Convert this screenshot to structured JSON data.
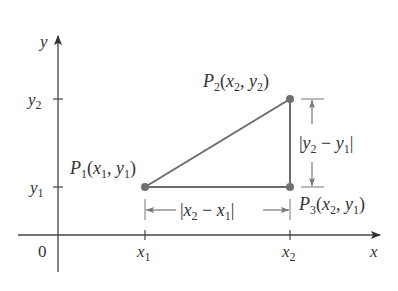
{
  "figure": {
    "colors": {
      "axis": "#444444",
      "triangle": "#6b6b6b",
      "point": "#707070",
      "dimension": "#777777",
      "text": "#333333"
    },
    "axes": {
      "x_label": "x",
      "y_label": "y",
      "origin_label": "0",
      "x_ticks": [
        {
          "name": "x",
          "sub": "1"
        },
        {
          "name": "x",
          "sub": "2"
        }
      ],
      "y_ticks": [
        {
          "name": "y",
          "sub": "2"
        },
        {
          "name": "y",
          "sub": "1"
        }
      ]
    },
    "points": [
      {
        "id": "P1",
        "label": "P",
        "sub": "1",
        "coords": "(x1, y1)",
        "cx": "x",
        "cxs": "1",
        "cy": "y",
        "cys": "1"
      },
      {
        "id": "P2",
        "label": "P",
        "sub": "2",
        "coords": "(x2, y2)",
        "cx": "x",
        "cxs": "2",
        "cy": "y",
        "cys": "2"
      },
      {
        "id": "P3",
        "label": "P",
        "sub": "3",
        "coords": "(x2, y1)",
        "cx": "x",
        "cxs": "2",
        "cy": "y",
        "cys": "1"
      }
    ],
    "dimensions": {
      "horizontal": {
        "text": "|x2 − x1|",
        "a": "x",
        "as": "2",
        "op": " − ",
        "b": "x",
        "bs": "1"
      },
      "vertical": {
        "text": "|y2 − y1|",
        "a": "y",
        "as": "2",
        "op": " − ",
        "b": "y",
        "bs": "1"
      }
    }
  }
}
